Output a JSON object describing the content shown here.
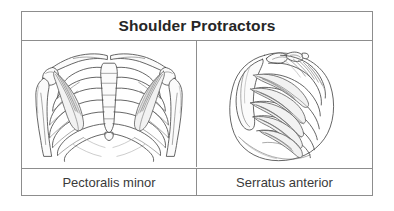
{
  "table": {
    "title": "Shoulder Protractors",
    "columns": [
      {
        "label": "Pectoralis minor",
        "figure_name": "anterior-thorax-pectoralis-minor-illustration"
      },
      {
        "label": "Serratus anterior",
        "figure_name": "lateral-thorax-serratus-anterior-illustration"
      }
    ],
    "colors": {
      "border": "#8d8d8d",
      "title_text": "#262626",
      "label_text": "#3a3a3a",
      "background": "#ffffff",
      "line_art": "#4a4a4a"
    }
  }
}
